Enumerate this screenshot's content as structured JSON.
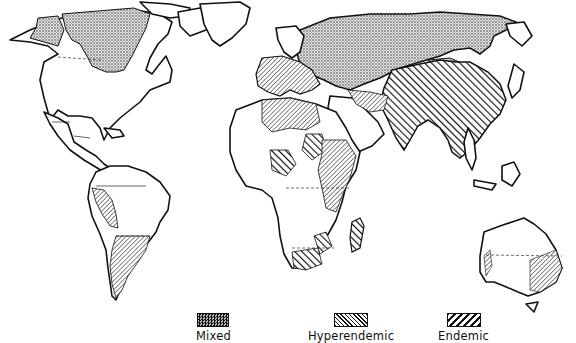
{
  "map": {
    "type": "world-distribution-map",
    "style": "black-and-white print, hatch-pattern choropleth",
    "regions": [
      {
        "area": "Northern Canada / Alaska",
        "category": "Mixed"
      },
      {
        "area": "Northern Eurasia / USSR",
        "category": "Mixed"
      },
      {
        "area": "Mongolia",
        "category": "Mixed"
      },
      {
        "area": "Europe (parts)",
        "category": "Hyperendemic"
      },
      {
        "area": "North Africa",
        "category": "Hyperendemic"
      },
      {
        "area": "East Africa",
        "category": "Hyperendemic"
      },
      {
        "area": "Western South America",
        "category": "Hyperendemic"
      },
      {
        "area": "Southern South America",
        "category": "Hyperendemic"
      },
      {
        "area": "Western Australia (coast)",
        "category": "Hyperendemic"
      },
      {
        "area": "Southeast Australia",
        "category": "Hyperendemic"
      },
      {
        "area": "China / South Asia / Southeast Asia",
        "category": "Endemic"
      },
      {
        "area": "West/Central Africa (parts)",
        "category": "Endemic"
      },
      {
        "area": "Southern Africa",
        "category": "Endemic"
      },
      {
        "area": "Madagascar",
        "category": "Endemic"
      }
    ]
  },
  "legend": {
    "items": [
      {
        "label": "Mixed",
        "pattern": "stipple"
      },
      {
        "label": "Hyperendemic",
        "pattern": "fine-diagonal-hatch"
      },
      {
        "label": "Endemic",
        "pattern": "bold-diagonal-hatch"
      }
    ]
  },
  "colors": {
    "ink": "#111111",
    "paper": "#ffffff"
  }
}
